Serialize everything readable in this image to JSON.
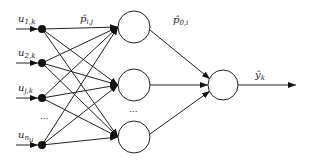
{
  "diagram": {
    "type": "neural-network",
    "inputs": [
      {
        "base": "u",
        "sub": "1,k",
        "y": 29
      },
      {
        "base": "u",
        "sub": "2,k",
        "y": 63
      },
      {
        "base": "u",
        "sub": "j,k",
        "y": 98
      },
      {
        "base": "u",
        "sub": "n_u",
        "sub_display": "n",
        "sub2": "u",
        "y": 145
      }
    ],
    "input_ellipsis": "...",
    "hidden_ellipsis": "...",
    "weight_label_input_hidden": {
      "base": "p̂",
      "sub": "i,j"
    },
    "weight_label_hidden_output": {
      "base": "p̂",
      "sub": "0,i"
    },
    "output_label": {
      "base": "ŷ",
      "sub": "k"
    },
    "hidden_neurons": 3,
    "output_neurons": 1,
    "colors": {
      "stroke": "#222222",
      "node_fill": "#111111",
      "background": "#ffffff"
    }
  }
}
